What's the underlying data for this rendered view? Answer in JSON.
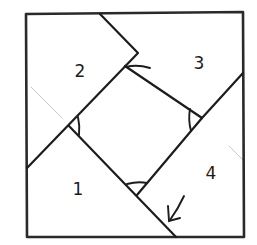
{
  "diagram": {
    "type": "hand-drawn geometry figure",
    "colors": {
      "ink": "#1c1c1c",
      "background": "#ffffff",
      "faint_guides": "#c9c9c9"
    },
    "pieces": [
      {
        "id": "1",
        "label": "1",
        "position": "bottom-left"
      },
      {
        "id": "2",
        "label": "2",
        "position": "top-left"
      },
      {
        "id": "3",
        "label": "3",
        "position": "top-right"
      },
      {
        "id": "4",
        "label": "4",
        "position": "bottom-right"
      }
    ],
    "angle_marks": [
      {
        "location": "top",
        "near_pieces": [
          "2",
          "3"
        ]
      },
      {
        "location": "right",
        "near_pieces": [
          "3",
          "4"
        ]
      },
      {
        "location": "bottom",
        "near_pieces": [
          "1",
          "4"
        ]
      },
      {
        "location": "left",
        "near_pieces": [
          "1",
          "2"
        ]
      }
    ],
    "arrow": {
      "direction": "down-left",
      "points_to": "bottom edge between pieces 1 and 4"
    }
  }
}
